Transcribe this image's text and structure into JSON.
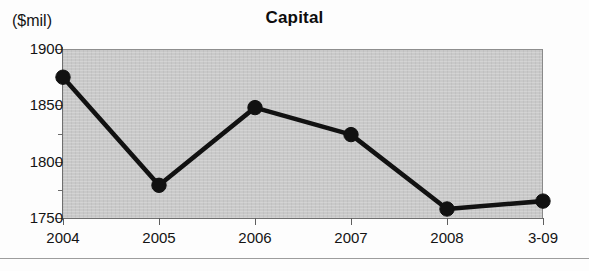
{
  "chart_data": {
    "type": "line",
    "title": "Capital",
    "xlabel": "",
    "ylabel": "($mil)",
    "categories": [
      "2004",
      "2005",
      "2006",
      "2007",
      "2008",
      "3-09"
    ],
    "values": [
      1875,
      1779,
      1848,
      1824,
      1758,
      1765
    ],
    "series": [
      {
        "name": "Capital",
        "values": [
          1875,
          1779,
          1848,
          1824,
          1758,
          1765
        ]
      }
    ],
    "ylim": [
      1750,
      1900
    ],
    "ytick_labels": [
      "1900",
      "1850",
      "1800",
      "1750"
    ],
    "ytick_values": [
      1900,
      1850,
      1800,
      1750
    ],
    "yminor_tick_values": [
      1875,
      1825,
      1775
    ],
    "ytick_interval": 50,
    "yminor_interval": 25,
    "grid": false,
    "legend": "none",
    "plot_background_color": "#c9c9c9",
    "line_color": "#111111",
    "marker_color": "#111111",
    "marker_shape": "circle"
  },
  "figure": {
    "title": "Capital",
    "y_unit_caption": "($mil)"
  },
  "axis": {
    "y_labels": [
      "1900",
      "1850",
      "1800",
      "1750"
    ],
    "x_labels": [
      "2004",
      "2005",
      "2006",
      "2007",
      "2008",
      "3-09"
    ]
  }
}
